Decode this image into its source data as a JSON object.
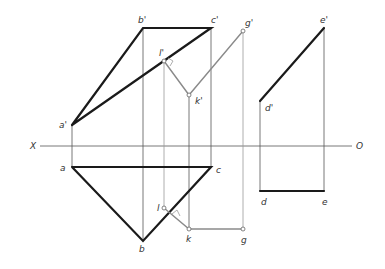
{
  "axis": {
    "left_label": "X",
    "right_label": "O"
  },
  "labels": {
    "a_prime": "a'",
    "b_prime": "b'",
    "c_prime": "c'",
    "g_prime": "g'",
    "l_prime": "l'",
    "k_prime": "k'",
    "d_prime": "d'",
    "e_prime": "e'",
    "a": "a",
    "b": "b",
    "c": "c",
    "l": "l",
    "k": "k",
    "g": "g",
    "d": "d",
    "e": "e"
  },
  "colors": {
    "object_line": "#1a1a1a",
    "construction_line": "#9a9a9a",
    "axis_line": "#555555"
  }
}
